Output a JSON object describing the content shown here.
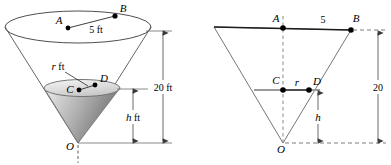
{
  "figure": {
    "colors": {
      "stroke": "#4a4a4a",
      "dark_stroke": "#1a1a1a",
      "gray_line": "#8c8c8c",
      "fill_light": "#e8e8e8",
      "fill_mid": "#b8b8b8",
      "fill_dark": "#8f8f8f",
      "dash": "#6b6b6b",
      "text": "#000000"
    },
    "left_diagram": {
      "name": "cone-3d-view",
      "points": {
        "A": "A",
        "B": "B",
        "C": "C",
        "D": "D",
        "O": "O"
      },
      "labels": {
        "radius_top": "5 ft",
        "radius_inner": "r ft",
        "height_total": "20 ft",
        "height_water": "h ft"
      }
    },
    "right_diagram": {
      "name": "cone-cross-section",
      "points": {
        "A": "A",
        "B": "B",
        "C": "C",
        "D": "D",
        "O": "O"
      },
      "labels": {
        "radius_top": "5",
        "radius_inner": "r",
        "height_total": "20",
        "height_water": "h"
      }
    }
  }
}
